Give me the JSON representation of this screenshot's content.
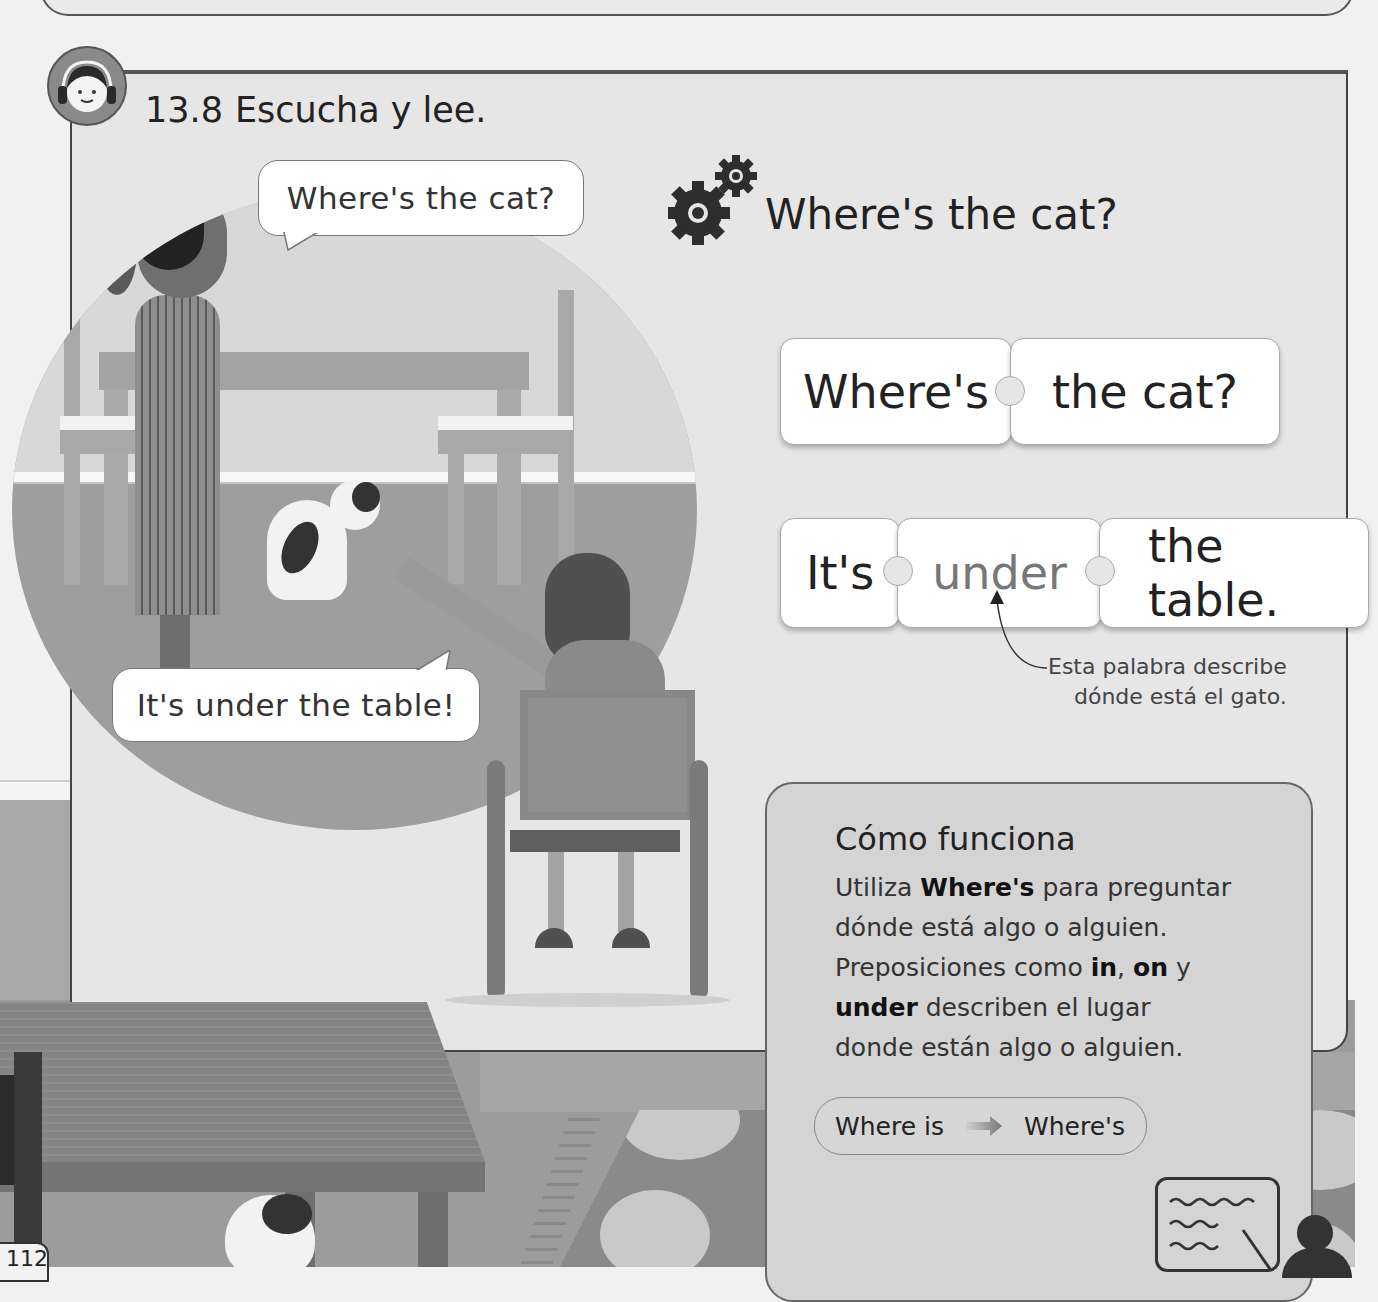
{
  "page": {
    "number": "112"
  },
  "exercise": {
    "number": "13.8",
    "instruction": "Escucha y lee.",
    "icon": "headphones-child-icon"
  },
  "scene": {
    "bubble_question": "Where's the cat?",
    "bubble_answer": "It's under the table!"
  },
  "grammar": {
    "icon": "gears-icon",
    "heading": "Where's the cat?",
    "question_pieces": [
      "Where's",
      "the cat?"
    ],
    "answer_pieces": [
      "It's",
      "under",
      "the table."
    ],
    "highlight_word": "under",
    "annotation_line1": "Esta palabra describe",
    "annotation_line2": "dónde está el gato."
  },
  "how_it_works": {
    "title": "Cómo funciona",
    "line1_pre": "Utiliza ",
    "line1_bold": "Where's",
    "line1_post": " para preguntar",
    "line2": "dónde está algo o alguien.",
    "line3_pre": "Preposiciones como ",
    "line3_bold1": "in",
    "line3_sep": ", ",
    "line3_bold2": "on",
    "line3_post": " y",
    "line4_bold": "under",
    "line4_post": " describen el lugar",
    "line5": "donde están algo o alguien.",
    "contraction_full": "Where is",
    "contraction_short": "Where's",
    "arrow_icon": "arrow-right-icon",
    "teacher_icon": "teacher-board-icon"
  },
  "colors": {
    "panel_bg": "#e6e6e6",
    "circle_bg": "#9e9e9e",
    "box_bg": "#d4d4d4",
    "highlight_text": "#777777",
    "text": "#222222"
  }
}
